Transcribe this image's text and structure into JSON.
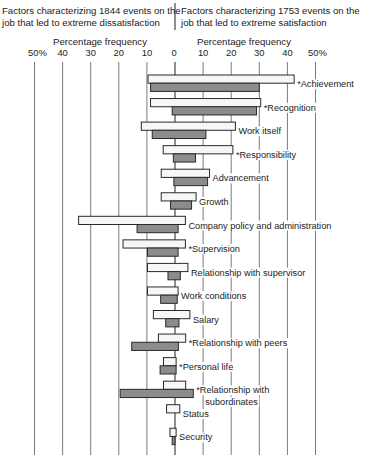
{
  "chart_data": {
    "type": "bar",
    "orientation": "horizontal-diverging",
    "left_header": [
      "Factors characterizing 1844 events on the",
      "job that led to extreme dissatisfaction"
    ],
    "right_header": [
      "Factors characterizing 1753 events on the",
      "job that led to extreme satisfaction"
    ],
    "left_axis_label": "Percentage frequency",
    "right_axis_label": "Percentage frequency",
    "left_ticks": [
      "50%",
      "40",
      "30",
      "20",
      "10"
    ],
    "zero_tick": "0",
    "right_ticks": [
      "10",
      "20",
      "30",
      "40",
      "50%"
    ],
    "xlim": [
      -50,
      50
    ],
    "grid": true,
    "legend": "none",
    "series": [
      {
        "name": "Satisfaction events (white bars)",
        "style": "white"
      },
      {
        "name": "Dissatisfaction events (gray bars)",
        "style": "gray"
      }
    ],
    "factors": [
      {
        "label": "Achievement",
        "starred": true,
        "white": [
          -9.6,
          42.4
        ],
        "gray": [
          -8.7,
          30.0
        ]
      },
      {
        "label": "Recognition",
        "starred": true,
        "white": [
          -8.7,
          30.5
        ],
        "gray": [
          -1.0,
          29.0
        ]
      },
      {
        "label": "Work itself",
        "starred": false,
        "white": [
          -12.0,
          21.5
        ],
        "gray": [
          -8.1,
          11.0
        ]
      },
      {
        "label": "Responsibility",
        "starred": true,
        "white": [
          -4.2,
          20.6
        ],
        "gray": [
          -0.6,
          7.3
        ]
      },
      {
        "label": "Advancement",
        "starred": false,
        "white": [
          -4.9,
          12.3
        ],
        "gray": [
          -0.4,
          11.6
        ]
      },
      {
        "label": "Growth",
        "starred": false,
        "white": [
          -4.9,
          7.5
        ],
        "gray": [
          -1.6,
          5.9
        ]
      },
      {
        "label": "Company policy and administration",
        "starred": false,
        "white": [
          -34.3,
          3.7
        ],
        "gray": [
          -13.5,
          1.1
        ]
      },
      {
        "label": "Supervision",
        "starred": true,
        "white": [
          -18.5,
          3.7
        ],
        "gray": [
          -9.8,
          1.1
        ]
      },
      {
        "label": "Relationship with supervisor",
        "starred": false,
        "white": [
          -9.8,
          4.6
        ],
        "gray": [
          -2.5,
          1.9
        ]
      },
      {
        "label": "Work conditions",
        "starred": false,
        "white": [
          -9.8,
          1.1
        ],
        "gray": [
          -5.1,
          0.8
        ]
      },
      {
        "label": "Salary",
        "starred": false,
        "white": [
          -7.7,
          5.3
        ],
        "gray": [
          -3.3,
          1.4
        ]
      },
      {
        "label": "Relationship with peers",
        "starred": true,
        "white": [
          -5.9,
          3.8
        ],
        "gray": [
          -15.4,
          1.2
        ]
      },
      {
        "label": "Personal life",
        "starred": true,
        "white": [
          -4.1,
          0.4
        ],
        "gray": [
          -5.3,
          0.4
        ]
      },
      {
        "label": "Relationship with subordinates",
        "label_lines": [
          "Relationship with",
          "subordinates"
        ],
        "starred": true,
        "white": [
          -4.1,
          3.8
        ],
        "gray": [
          -19.5,
          6.5
        ]
      },
      {
        "label": "Status",
        "starred": false,
        "white": [
          -3.0,
          1.7
        ],
        "gray": null
      },
      {
        "label": "Security",
        "starred": false,
        "white": [
          -1.8,
          0.4
        ],
        "gray": [
          -1.0,
          0.0
        ]
      }
    ]
  }
}
